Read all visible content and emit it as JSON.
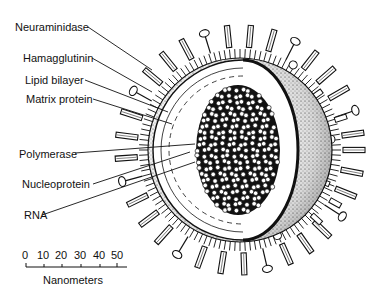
{
  "diagram": {
    "labels": [
      {
        "id": "neuraminidase",
        "text": "Neuraminidase",
        "x": 15,
        "y": 27,
        "lineEnd": [
          152,
          70
        ]
      },
      {
        "id": "hamagglutinin",
        "text": "Hamagglutinin",
        "x": 23,
        "y": 58,
        "lineEnd": [
          152,
          92
        ]
      },
      {
        "id": "lipid-bilayer",
        "text": "Lipid bilayer",
        "x": 25,
        "y": 80,
        "lineEnd": [
          168,
          112
        ]
      },
      {
        "id": "matrix-protein",
        "text": "Matrix protein",
        "x": 26,
        "y": 98,
        "lineEnd": [
          172,
          124
        ]
      },
      {
        "id": "polymerase",
        "text": "Polymerase",
        "x": 19,
        "y": 148,
        "lineEnd": [
          195,
          144
        ]
      },
      {
        "id": "nucleoprotein",
        "text": "Nucleoprotein",
        "x": 22,
        "y": 178,
        "lineEnd": [
          190,
          152
        ]
      },
      {
        "id": "rna",
        "text": "RNA",
        "x": 24,
        "y": 210,
        "lineEnd": [
          195,
          162
        ]
      }
    ],
    "scale_bar": {
      "ticks": [
        "0",
        "10",
        "20",
        "30",
        "40",
        "50"
      ],
      "unit_label": "Nanometers"
    },
    "colors": {
      "ink": "#111111",
      "background": "#ffffff",
      "stipple": "#888888"
    }
  }
}
